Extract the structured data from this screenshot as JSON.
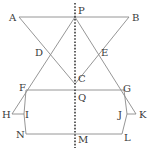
{
  "diagram": {
    "colors": {
      "line": "#8a8a8a",
      "axis": "#3a3a3a",
      "label": "#3a3a3a"
    },
    "points": {
      "A": {
        "label": "A",
        "x": 19,
        "y": 17
      },
      "P": {
        "label": "P",
        "x": 75,
        "y": 17
      },
      "B": {
        "label": "B",
        "x": 129,
        "y": 17
      },
      "D": {
        "label": "D",
        "x": 47,
        "y": 53
      },
      "E": {
        "label": "E",
        "x": 98,
        "y": 53
      },
      "C": {
        "label": "C",
        "x": 75,
        "y": 84
      },
      "F": {
        "label": "F",
        "x": 26,
        "y": 90
      },
      "G": {
        "label": "G",
        "x": 124,
        "y": 90
      },
      "Q": {
        "label": "Q",
        "x": 75,
        "y": 90
      },
      "H": {
        "label": "H",
        "x": 12,
        "y": 114
      },
      "I": {
        "label": "I",
        "x": 24,
        "y": 114
      },
      "J": {
        "label": "J",
        "x": 127,
        "y": 114
      },
      "K": {
        "label": "K",
        "x": 136,
        "y": 114
      },
      "N": {
        "label": "N",
        "x": 26,
        "y": 134
      },
      "M": {
        "label": "M",
        "x": 75,
        "y": 134
      },
      "L": {
        "label": "L",
        "x": 122,
        "y": 134
      }
    },
    "segments": [
      [
        "A",
        "B"
      ],
      [
        "A",
        "C"
      ],
      [
        "B",
        "C"
      ],
      [
        "P",
        "H"
      ],
      [
        "P",
        "K"
      ],
      [
        "F",
        "G"
      ],
      [
        "H",
        "I"
      ],
      [
        "J",
        "K"
      ],
      [
        "F",
        "I"
      ],
      [
        "I",
        "N"
      ],
      [
        "G",
        "J"
      ],
      [
        "J",
        "L"
      ],
      [
        "N",
        "L"
      ]
    ],
    "axis": {
      "style": "dotted",
      "from": [
        "P",
        "top"
      ],
      "to": [
        "M",
        "bottom"
      ]
    }
  }
}
